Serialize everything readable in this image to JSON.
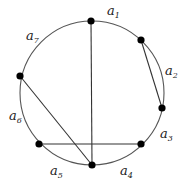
{
  "diagram": {
    "type": "chord-diagram",
    "circle": {
      "cx": 92,
      "cy": 93,
      "r": 72
    },
    "nodes": [
      {
        "id": "n1",
        "x": 91,
        "y": 21
      },
      {
        "id": "n2",
        "x": 141,
        "y": 40
      },
      {
        "id": "n3",
        "x": 162,
        "y": 108
      },
      {
        "id": "n4",
        "x": 141,
        "y": 144
      },
      {
        "id": "n5",
        "x": 92,
        "y": 165
      },
      {
        "id": "n6",
        "x": 39,
        "y": 144
      },
      {
        "id": "n7",
        "x": 20,
        "y": 76
      }
    ],
    "chords": [
      {
        "from": "n1",
        "to": "n5"
      },
      {
        "from": "n2",
        "to": "n3"
      },
      {
        "from": "n7",
        "to": "n5"
      },
      {
        "from": "n6",
        "to": "n4"
      }
    ],
    "arc_labels": [
      {
        "base": "a",
        "sub": "1",
        "x": 107,
        "y": 15
      },
      {
        "base": "a",
        "sub": "2",
        "x": 165,
        "y": 75
      },
      {
        "base": "a",
        "sub": "3",
        "x": 160,
        "y": 138
      },
      {
        "base": "a",
        "sub": "4",
        "x": 120,
        "y": 175
      },
      {
        "base": "a",
        "sub": "5",
        "x": 50,
        "y": 175
      },
      {
        "base": "a",
        "sub": "6",
        "x": 9,
        "y": 120
      },
      {
        "base": "a",
        "sub": "7",
        "x": 26,
        "y": 40
      }
    ]
  }
}
